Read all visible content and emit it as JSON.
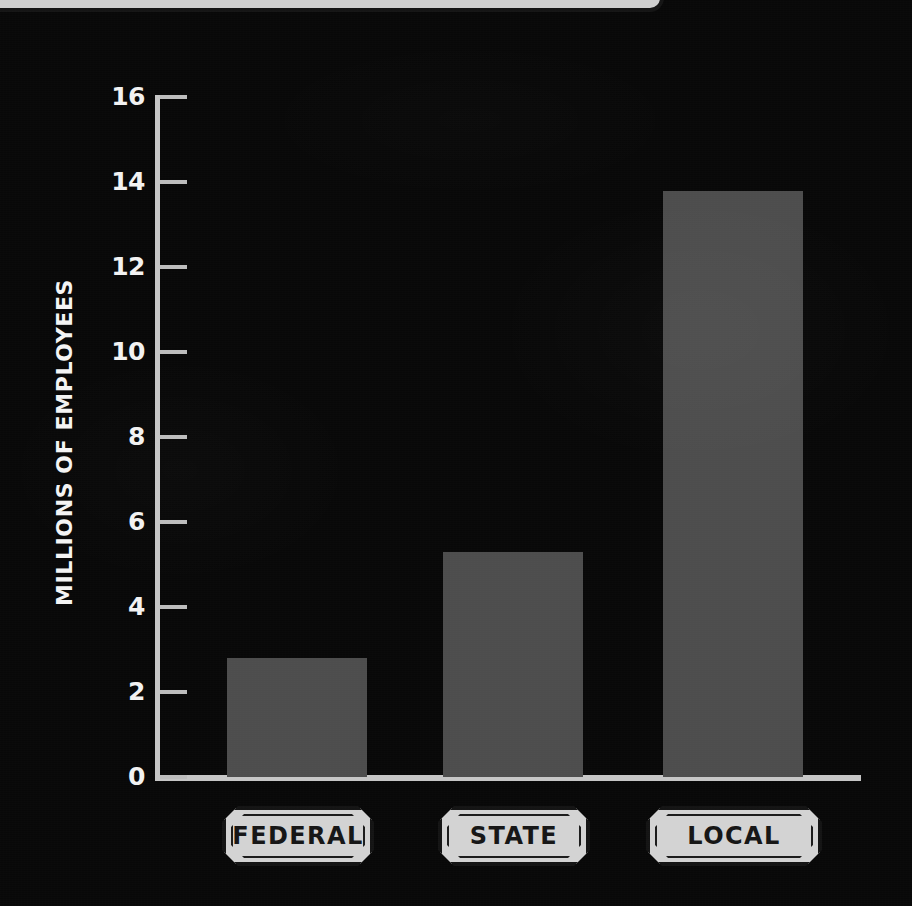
{
  "banner": {
    "name": "top-cropped-banner",
    "visible_text": ""
  },
  "chart_data": {
    "type": "bar",
    "title": "",
    "subtitle": "",
    "xlabel": "",
    "ylabel": "MILLIONS OF EMPLOYEES",
    "categories": [
      "FEDERAL",
      "STATE",
      "LOCAL"
    ],
    "values": [
      2.8,
      5.3,
      13.8
    ],
    "ylim": [
      0,
      16
    ],
    "yticks": [
      0,
      2,
      4,
      6,
      8,
      10,
      12,
      14,
      16
    ],
    "ytick_labels": [
      "0",
      "2",
      "4",
      "6",
      "8",
      "10",
      "12",
      "14",
      "16"
    ],
    "grid": false,
    "legend": null,
    "bar_color": "#4d4d4d",
    "axis_color": "#c6c6c6",
    "background_color": "#080808",
    "text_color": "#f2f2f2",
    "badge_color": "#d3d3d3",
    "badge_text_color": "#161616",
    "annotations": []
  }
}
